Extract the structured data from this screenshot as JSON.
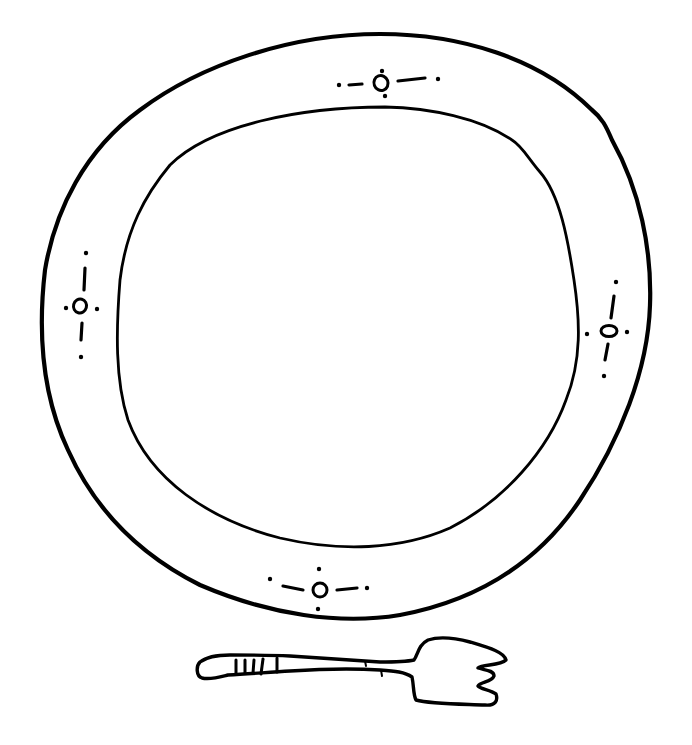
{
  "image": {
    "title": "Line drawing of a plate and fork",
    "background": "#ffffff",
    "ink_color": "#000000"
  },
  "plate": {
    "outer_rim": "outer-rim",
    "inner_well": "inner-well",
    "ornaments": [
      {
        "position": "top",
        "x": 381,
        "y": 83,
        "orientation": "horizontal"
      },
      {
        "position": "left",
        "x": 80,
        "y": 306,
        "orientation": "vertical"
      },
      {
        "position": "right",
        "x": 608,
        "y": 330,
        "orientation": "vertical"
      },
      {
        "position": "bottom",
        "x": 320,
        "y": 590,
        "orientation": "horizontal"
      }
    ]
  },
  "fork": {
    "handle_bands": 4,
    "tines": 3
  },
  "caption": "Hand-drawn plate with rim ornaments and a fork below"
}
